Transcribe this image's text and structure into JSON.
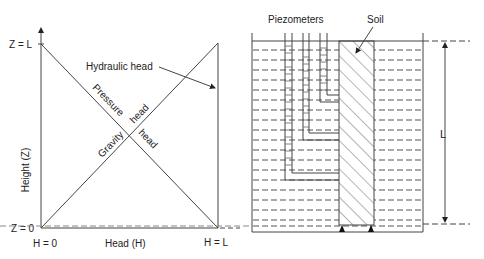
{
  "left_diagram": {
    "y_axis_label": "Height (Z)",
    "x_axis_label": "Head (H)",
    "y_top_label": "Z = L",
    "y_bottom_label": "Z = 0",
    "x_left_label": "H = 0",
    "x_right_label": "H = L",
    "hydraulic_head_label": "Hydraulic head",
    "pressure_label": "Pressure",
    "pressure_head_label": "head",
    "gravity_label": "Gravity",
    "gravity_head_label": "head"
  },
  "right_diagram": {
    "piezometers_label": "Piezometers",
    "soil_label": "Soil",
    "length_label": "L"
  }
}
